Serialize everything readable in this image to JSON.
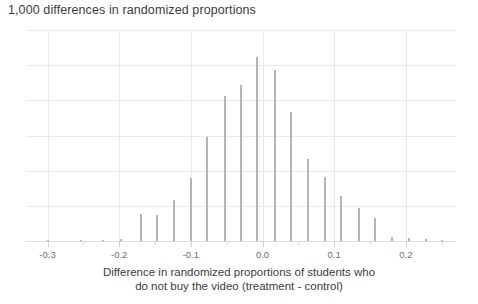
{
  "chart_data": {
    "type": "bar",
    "title": "1,000 differences in randomized proportions",
    "subtitle": "",
    "xlabel_line1": "Difference in randomized proportions of students who",
    "xlabel_line2": "do not buy the video (treatment - control)",
    "ylabel": "",
    "xlim": [
      -0.33,
      0.27
    ],
    "ylim": [
      0,
      210
    ],
    "grid": true,
    "legend": null,
    "xticks": [
      -0.3,
      -0.2,
      -0.1,
      0.0,
      0.1,
      0.2
    ],
    "xtick_labels": [
      "-0.3",
      "-0.2",
      "-0.1",
      "0.0",
      "0.1",
      "0.2"
    ],
    "xticks_minor": [
      -0.25,
      -0.15,
      -0.05,
      0.05,
      0.15,
      0.25
    ],
    "yticks": [
      0,
      35,
      70,
      105,
      140,
      175,
      210
    ],
    "ytick_labels": [],
    "bin_width": 0.0167,
    "x": [
      -0.3,
      -0.2833,
      -0.2667,
      -0.25,
      -0.2333,
      -0.2167,
      -0.2,
      -0.1833,
      -0.1667,
      -0.15,
      -0.1333,
      -0.1167,
      -0.1,
      -0.0833,
      -0.0667,
      -0.05,
      -0.0333,
      -0.0167,
      0.0,
      0.0167,
      0.0333,
      0.05,
      0.0667,
      0.0833,
      0.1,
      0.1167,
      0.1333,
      0.15,
      0.1667,
      0.1833,
      0.2,
      0.2167,
      0.2333,
      0.25
    ],
    "values": [
      1,
      0,
      0,
      1,
      0,
      0,
      1,
      0,
      27,
      27,
      41,
      0,
      63,
      0,
      104,
      0,
      144,
      0,
      155,
      0,
      183,
      0,
      170,
      0,
      128,
      0,
      82,
      0,
      64,
      0,
      45,
      0,
      33,
      0
    ],
    "bars": [
      {
        "x": -0.3,
        "count": 1
      },
      {
        "x": -0.253,
        "count": 1
      },
      {
        "x": -0.222,
        "count": 1
      },
      {
        "x": -0.197,
        "count": 2
      },
      {
        "x": -0.17,
        "count": 27
      },
      {
        "x": -0.147,
        "count": 26
      },
      {
        "x": -0.124,
        "count": 41
      },
      {
        "x": -0.1,
        "count": 63
      },
      {
        "x": -0.077,
        "count": 104
      },
      {
        "x": -0.053,
        "count": 144
      },
      {
        "x": -0.03,
        "count": 155
      },
      {
        "x": -0.007,
        "count": 183
      },
      {
        "x": 0.017,
        "count": 170
      },
      {
        "x": 0.04,
        "count": 128
      },
      {
        "x": 0.064,
        "count": 82
      },
      {
        "x": 0.087,
        "count": 64
      },
      {
        "x": 0.11,
        "count": 45
      },
      {
        "x": 0.134,
        "count": 33
      },
      {
        "x": 0.157,
        "count": 23
      },
      {
        "x": 0.181,
        "count": 4
      },
      {
        "x": 0.204,
        "count": 3
      },
      {
        "x": 0.228,
        "count": 2
      },
      {
        "x": 0.251,
        "count": 1
      }
    ],
    "total_simulations": 1000,
    "colors": {
      "bar": "#b4b4b4",
      "grid": "#e9e9e9",
      "axis": "#dcdcdc",
      "text": "#3c3c3c",
      "tick_text": "#707070",
      "background": "#ffffff"
    }
  }
}
